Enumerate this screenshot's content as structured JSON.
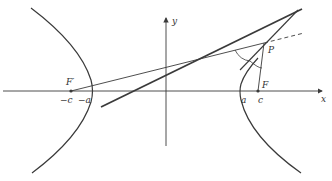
{
  "figure": {
    "type": "hyperbola-reflection-property",
    "colors": {
      "stroke": "#3a3a3a",
      "background": "#ffffff"
    },
    "axes": {
      "x_label": "x",
      "y_label": "y"
    },
    "points": {
      "left_focus": "F′",
      "right_focus": "F",
      "point_on_curve": "P"
    },
    "ticks": {
      "neg_c": "−c",
      "neg_a": "−a",
      "a": "a",
      "c": "c"
    }
  }
}
